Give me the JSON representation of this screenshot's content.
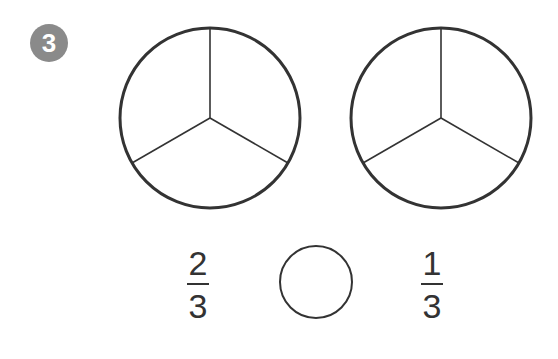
{
  "problem": {
    "number": "3"
  },
  "circles": [
    {
      "id": "left",
      "divisions": 3,
      "shaded": 0
    },
    {
      "id": "right",
      "divisions": 3,
      "shaded": 0
    }
  ],
  "comparison": {
    "left_fraction": {
      "numerator": "2",
      "denominator": "3"
    },
    "answer_blank": "",
    "right_fraction": {
      "numerator": "1",
      "denominator": "3"
    }
  },
  "colors": {
    "badge": "#8a8a8a",
    "stroke": "#333333"
  }
}
